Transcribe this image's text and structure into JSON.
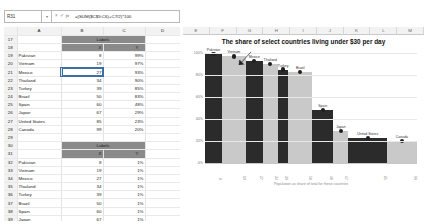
{
  "formula_bar": {
    "name_box": "R31",
    "dropdown_icon": "chevron-down-icon",
    "cancel_icon": "×",
    "confirm_icon": "✓",
    "fx_icon": "fx",
    "formula": "=(SUM($C$5:C6)+C7/2)*100"
  },
  "sheet": {
    "columns": [
      "A",
      "B",
      "C",
      "D",
      "E"
    ],
    "rows": [
      {
        "n": "17",
        "a": "",
        "b": "Labels",
        "c": "",
        "d": "",
        "style": "band-title"
      },
      {
        "n": "18",
        "a": "",
        "b": "X",
        "c": "Y",
        "d": "",
        "style": "band-head"
      },
      {
        "n": "19",
        "a": "Pakistan",
        "b": "8",
        "c": "99%",
        "d": ""
      },
      {
        "n": "20",
        "a": "Vietnam",
        "b": "19",
        "c": "97%",
        "d": ""
      },
      {
        "n": "21",
        "a": "Mexico",
        "b": "27",
        "c": "93%",
        "d": "",
        "selected": true
      },
      {
        "n": "22",
        "a": "Thailand",
        "b": "34",
        "c": "90%",
        "d": ""
      },
      {
        "n": "23",
        "a": "Turkey",
        "b": "39",
        "c": "85%",
        "d": ""
      },
      {
        "n": "24",
        "a": "Brazil",
        "b": "50",
        "c": "83%",
        "d": ""
      },
      {
        "n": "25",
        "a": "Spain",
        "b": "60",
        "c": "48%",
        "d": ""
      },
      {
        "n": "26",
        "a": "Japan",
        "b": "67",
        "c": "29%",
        "d": ""
      },
      {
        "n": "27",
        "a": "United States",
        "b": "85",
        "c": "23%",
        "d": ""
      },
      {
        "n": "28",
        "a": "Canada",
        "b": "99",
        "c": "20%",
        "d": ""
      },
      {
        "n": "29",
        "a": "",
        "b": "",
        "c": "",
        "d": ""
      },
      {
        "n": "30",
        "a": "",
        "b": "Labels",
        "c": "",
        "d": "",
        "style": "band-title"
      },
      {
        "n": "31",
        "a": "",
        "b": "X",
        "c": "Y",
        "d": "",
        "style": "band-head"
      },
      {
        "n": "32",
        "a": "Pakistan",
        "b": "8",
        "c": "1%",
        "d": ""
      },
      {
        "n": "33",
        "a": "Vietnam",
        "b": "19",
        "c": "1%",
        "d": ""
      },
      {
        "n": "34",
        "a": "Mexico",
        "b": "27",
        "c": "1%",
        "d": ""
      },
      {
        "n": "35",
        "a": "Thailand",
        "b": "34",
        "c": "1%",
        "d": ""
      },
      {
        "n": "36",
        "a": "Turkey",
        "b": "39",
        "c": "1%",
        "d": ""
      },
      {
        "n": "37",
        "a": "Brazil",
        "b": "50",
        "c": "1%",
        "d": ""
      },
      {
        "n": "38",
        "a": "Spain",
        "b": "60",
        "c": "1%",
        "d": ""
      },
      {
        "n": "39",
        "a": "Japan",
        "b": "67",
        "c": "1%",
        "d": ""
      },
      {
        "n": "40",
        "a": "United States",
        "b": "85",
        "c": "1%",
        "d": ""
      },
      {
        "n": "41",
        "a": "Canada",
        "b": "99",
        "c": "1%",
        "d": ""
      },
      {
        "n": "42",
        "a": "",
        "b": "",
        "c": "",
        "d": ""
      }
    ]
  },
  "chart_columns": [
    "E",
    "F",
    "G",
    "H",
    "I",
    "J",
    "K",
    "L",
    "M"
  ],
  "chart_data": {
    "type": "bar",
    "title": "The share of select countries living under $30 per day",
    "xlabel": "Population as share of total for these countries",
    "ylabel": "",
    "ylim": [
      0,
      100
    ],
    "ytick_labels": [
      "100%",
      "80%",
      "60%",
      "40%",
      "20%",
      "0%"
    ],
    "ytick_values": [
      100,
      80,
      60,
      40,
      20,
      0
    ],
    "grid": true,
    "legend": "none",
    "marimekko": true,
    "annotation": "callout-arrow-mexico",
    "categories": [
      "Pakistan",
      "Vietnam",
      "Mexico",
      "Thailand",
      "Turkey",
      "Brazil",
      "Spain",
      "Japan",
      "United States",
      "Canada"
    ],
    "values": [
      99,
      97,
      93,
      90,
      85,
      83,
      48,
      29,
      23,
      20
    ],
    "widths": [
      8,
      11,
      8,
      7,
      5,
      11,
      10,
      7,
      18,
      14
    ],
    "cumulative_x": [
      8,
      19,
      27,
      34,
      39,
      50,
      60,
      67,
      85,
      99
    ],
    "xtick_labels": [
      "8",
      "19",
      "27",
      "34",
      "39",
      "50",
      "60",
      "67",
      "85",
      "99"
    ],
    "marker_values": [
      99,
      97,
      93,
      90,
      85,
      83,
      48,
      29,
      23,
      20
    ],
    "bar_colors": [
      "#2b2b2b",
      "#c9c9c9",
      "#2b2b2b",
      "#c9c9c9",
      "#2b2b2b",
      "#c9c9c9",
      "#2b2b2b",
      "#c9c9c9",
      "#2b2b2b",
      "#c9c9c9"
    ]
  }
}
